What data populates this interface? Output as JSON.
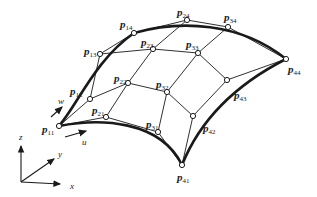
{
  "diagram": {
    "points": [
      {
        "id": "p11",
        "main": "p",
        "sub": "11",
        "x": 59,
        "y": 126,
        "lx": 42,
        "ly": 133
      },
      {
        "id": "p12",
        "main": "p",
        "sub": "12",
        "x": 90,
        "y": 99,
        "lx": 70,
        "ly": 95
      },
      {
        "id": "p13",
        "main": "p",
        "sub": "13",
        "x": 100,
        "y": 54,
        "lx": 84,
        "ly": 55
      },
      {
        "id": "p14",
        "main": "p",
        "sub": "14",
        "x": 134,
        "y": 33,
        "lx": 120,
        "ly": 28
      },
      {
        "id": "p21",
        "main": "p",
        "sub": "21",
        "x": 106,
        "y": 117,
        "lx": 92,
        "ly": 114
      },
      {
        "id": "p22",
        "main": "p",
        "sub": "22",
        "x": 128,
        "y": 83,
        "lx": 114,
        "ly": 82
      },
      {
        "id": "p23",
        "main": "p",
        "sub": "23",
        "x": 153,
        "y": 49,
        "lx": 141,
        "ly": 46
      },
      {
        "id": "p24",
        "main": "p",
        "sub": "24",
        "x": 187,
        "y": 20,
        "lx": 177,
        "ly": 16
      },
      {
        "id": "p31",
        "main": "p",
        "sub": "31",
        "x": 158,
        "y": 132,
        "lx": 146,
        "ly": 128
      },
      {
        "id": "p32",
        "main": "p",
        "sub": "32",
        "x": 167,
        "y": 92,
        "lx": 156,
        "ly": 88
      },
      {
        "id": "p33",
        "main": "p",
        "sub": "33",
        "x": 198,
        "y": 53,
        "lx": 186,
        "ly": 48
      },
      {
        "id": "p34",
        "main": "p",
        "sub": "34",
        "x": 228,
        "y": 27,
        "lx": 224,
        "ly": 21
      },
      {
        "id": "p41",
        "main": "p",
        "sub": "41",
        "x": 182,
        "y": 165,
        "lx": 177,
        "ly": 181
      },
      {
        "id": "p42",
        "main": "p",
        "sub": "42",
        "x": 193,
        "y": 116,
        "lx": 203,
        "ly": 132
      },
      {
        "id": "p43",
        "main": "p",
        "sub": "43",
        "x": 227,
        "y": 80,
        "lx": 234,
        "ly": 99
      },
      {
        "id": "p44",
        "main": "p",
        "sub": "44",
        "x": 286,
        "y": 59,
        "lx": 288,
        "ly": 73
      }
    ],
    "param_labels": {
      "u": "u",
      "w": "w"
    },
    "axes": {
      "x": "x",
      "y": "y",
      "z": "z"
    },
    "colors": {
      "line": "#1a1a1a",
      "background": "#ffffff"
    }
  }
}
